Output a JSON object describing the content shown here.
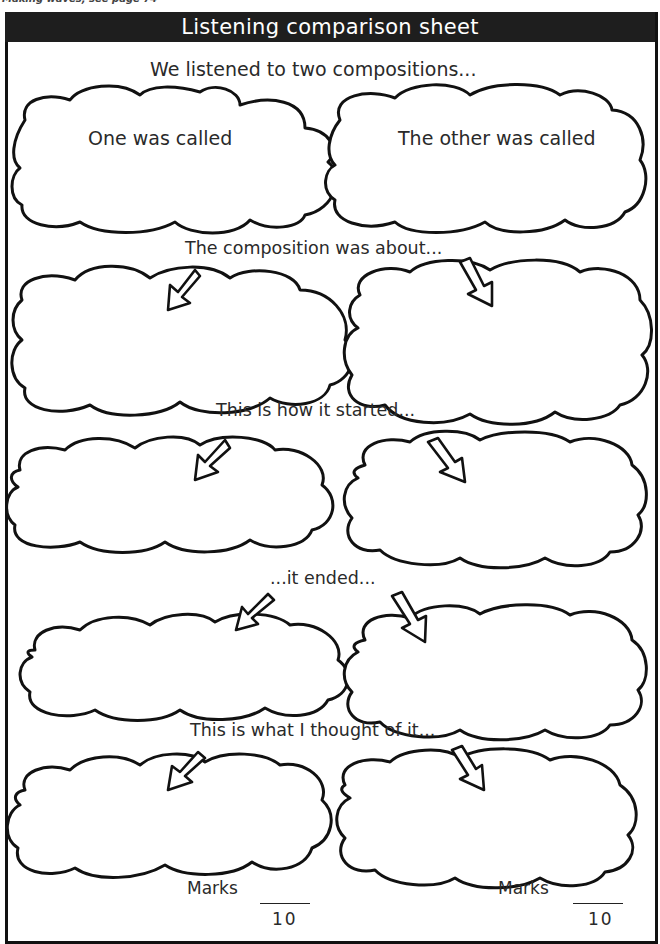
{
  "top_note": "Making waves, see page 74",
  "title": "Listening comparison sheet",
  "prompts": {
    "intro": "We listened to two compositions...",
    "about": "The composition was about...",
    "started": "This is how it started...",
    "ended": "...it ended...",
    "thought": "This is what I thought of it..."
  },
  "clouds": {
    "left_name": "One was called",
    "right_name": "The other was called"
  },
  "marks": {
    "left": {
      "label": "Marks",
      "denominator": "10"
    },
    "right": {
      "label": "Marks",
      "denominator": "10"
    }
  }
}
